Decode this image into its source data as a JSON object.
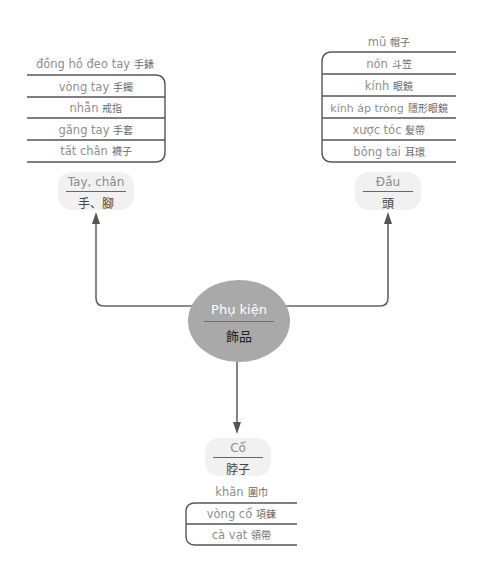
{
  "center": {
    "vi": "Phụ kiện",
    "zh": "飾品",
    "color": "#a9a9a9"
  },
  "categories": {
    "hands": {
      "vi": "Tay, chân",
      "zh": "手、腳",
      "header": {
        "vi": "đồng hồ đeo tay",
        "zh": "手錶"
      },
      "items": [
        {
          "vi": "vòng tay",
          "zh": "手鐲"
        },
        {
          "vi": "nhẫn",
          "zh": "戒指"
        },
        {
          "vi": "găng tay",
          "zh": "手套"
        },
        {
          "vi": "tất chân",
          "zh": "襪子"
        }
      ]
    },
    "head": {
      "vi": "Đầu",
      "zh": "頭",
      "header": {
        "vi": "mũ",
        "zh": "帽子"
      },
      "items": [
        {
          "vi": "nón",
          "zh": "斗笠"
        },
        {
          "vi": "kính",
          "zh": "眼鏡"
        },
        {
          "vi": "kính áp tròng",
          "zh": "隱形眼鏡"
        },
        {
          "vi": "xược tóc",
          "zh": "髮帶"
        },
        {
          "vi": "bông tai",
          "zh": "耳環"
        }
      ]
    },
    "neck": {
      "vi": "Cổ",
      "zh": "脖子",
      "header": {
        "vi": "khăn",
        "zh": "圍巾"
      },
      "items": [
        {
          "vi": "vòng cổ",
          "zh": "項鍊"
        },
        {
          "vi": "cà vạt",
          "zh": "領帶"
        }
      ]
    }
  }
}
